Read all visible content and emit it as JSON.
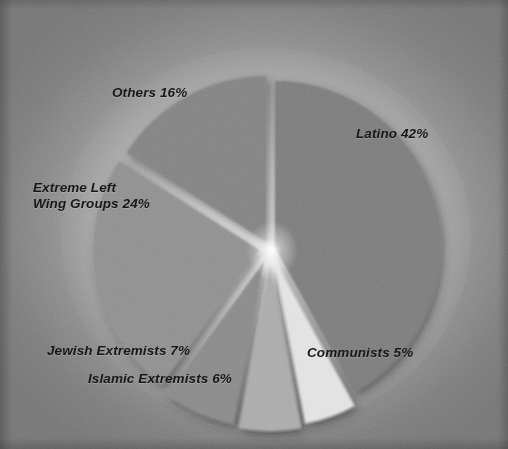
{
  "chart_data": {
    "type": "pie",
    "title": "",
    "subtitle": "",
    "xlabel": "",
    "ylabel": "",
    "legend_position": "none",
    "grid": false,
    "value_unit": "%",
    "total": 100,
    "categories": [
      "Latino",
      "Communists",
      "Islamic Extremists",
      "Jewish Extremists",
      "Extreme Left Wing Groups",
      "Others"
    ],
    "values": [
      42,
      5,
      6,
      7,
      24,
      16
    ],
    "labels": [
      "Latino 42%",
      "Communists 5%",
      "Islamic Extremists 6%",
      "Jewish Extremists 7%",
      "Extreme Left Wing Groups 24%",
      "Others 16%"
    ],
    "slices": [
      {
        "name": "Latino",
        "value": 42,
        "label": "Latino 42%",
        "color": "#7d7d7d",
        "exploded": true
      },
      {
        "name": "Communists",
        "value": 5,
        "label": "Communists 5%",
        "color": "#e2e2e2",
        "exploded": true
      },
      {
        "name": "Islamic Extremists",
        "value": 6,
        "label": "Islamic Extremists 6%",
        "color": "#ababab",
        "exploded": true
      },
      {
        "name": "Jewish Extremists",
        "value": 7,
        "label": "Jewish Extremists 7%",
        "color": "#8a8a8a",
        "exploded": true
      },
      {
        "name": "Extreme Left Wing Groups",
        "value": 24,
        "label": "Extreme Left Wing Groups 24%",
        "color": "#909090",
        "exploded": true
      },
      {
        "name": "Others",
        "value": 16,
        "label": "Others 16%",
        "color": "#838383",
        "exploded": true
      }
    ]
  },
  "labels": {
    "others": "Others 16%",
    "latino": "Latino 42%",
    "extreme_left_line1": "Extreme Left",
    "extreme_left_line2": "Wing Groups 24%",
    "jewish": "Jewish Extremists 7%",
    "islamic": "Islamic Extremists 6%",
    "communists": "Communists 5%"
  },
  "colors": {
    "background_center": "#d2d2d2",
    "background_edge": "#767676",
    "label_text": "#16171a",
    "latino": "#7d7d7d",
    "others": "#838383",
    "extreme_left": "#909090",
    "jewish": "#8a8a8a",
    "islamic": "#ababab",
    "communists": "#e2e2e2"
  }
}
